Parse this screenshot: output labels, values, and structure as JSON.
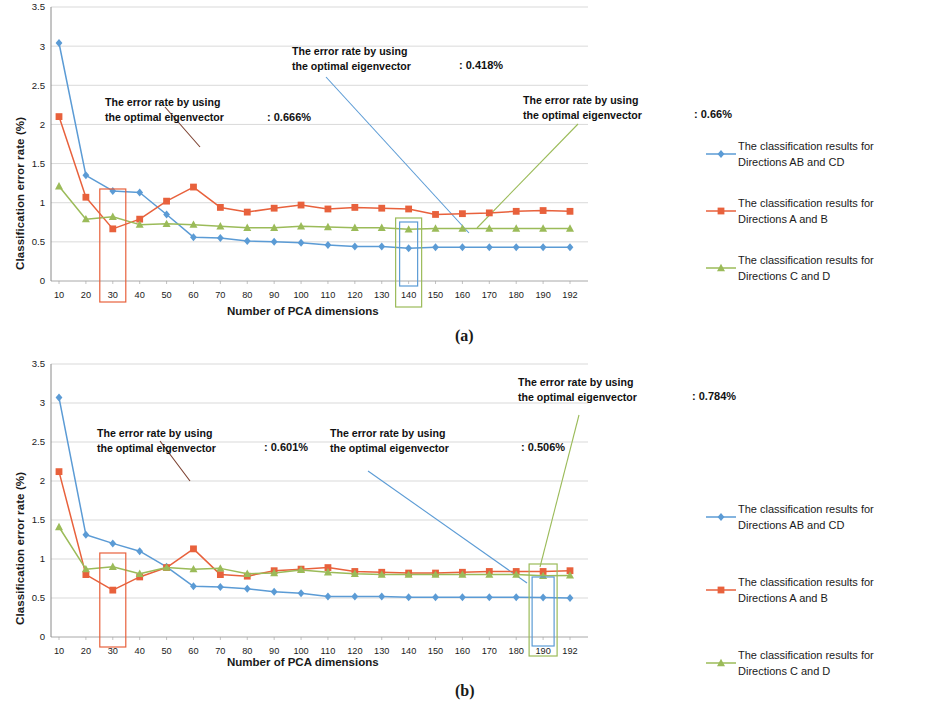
{
  "figure": {
    "panels": [
      {
        "id": "a",
        "caption": "(a)",
        "axis": {
          "ylabel": "Classification error rate (%)",
          "xlabel": "Number of PCA dimensions",
          "yticks": [
            "0",
            "0.5",
            "1",
            "1.5",
            "2",
            "2.5",
            "3",
            "3.5"
          ],
          "xticks": [
            "10",
            "20",
            "30",
            "40",
            "50",
            "60",
            "70",
            "80",
            "90",
            "100",
            "110",
            "120",
            "130",
            "140",
            "150",
            "160",
            "170",
            "180",
            "190",
            "192"
          ]
        },
        "annotations": [
          {
            "name": "annotation-30",
            "line1": "The error rate by using",
            "line2": "the optimal eigenvector",
            "value": ": 0.666%",
            "color": "#E8613C"
          },
          {
            "name": "annotation-140-blue",
            "line1": "The error rate by using",
            "line2": "the optimal eigenvector",
            "value": ": 0.418%",
            "color": "#5B9BD5"
          },
          {
            "name": "annotation-140-green",
            "line1": "The error rate by using",
            "line2": "the optimal eigenvector",
            "value": ": 0.66%",
            "color": "#9BBB59"
          }
        ],
        "highlight_boxes": [
          {
            "name": "highlight-box-30",
            "label": "30",
            "color": "#E8613C"
          },
          {
            "name": "highlight-box-140-blue",
            "label": "140",
            "color": "#5B9BD5"
          },
          {
            "name": "highlight-box-140-green",
            "label": "140",
            "color": "#9BBB59"
          }
        ]
      },
      {
        "id": "b",
        "caption": "(b)",
        "axis": {
          "ylabel": "Classification error rate (%)",
          "xlabel": "Number of PCA dimensions",
          "yticks": [
            "0",
            "0.5",
            "1",
            "1.5",
            "2",
            "2.5",
            "3",
            "3.5"
          ],
          "xticks": [
            "10",
            "20",
            "30",
            "40",
            "50",
            "60",
            "70",
            "80",
            "90",
            "100",
            "110",
            "120",
            "130",
            "140",
            "150",
            "160",
            "170",
            "180",
            "190",
            "192"
          ]
        },
        "annotations": [
          {
            "name": "annotation-30",
            "line1": "The error rate by using",
            "line2": "the optimal eigenvector",
            "value": ": 0.601%",
            "color": "#E8613C"
          },
          {
            "name": "annotation-190-blue",
            "line1": "The error rate by using",
            "line2": "the optimal eigenvector",
            "value": ": 0.506%",
            "color": "#5B9BD5"
          },
          {
            "name": "annotation-190-green",
            "line1": "The error rate by using",
            "line2": "the optimal eigenvector",
            "value": ": 0.784%",
            "color": "#9BBB59"
          }
        ],
        "highlight_boxes": [
          {
            "name": "highlight-box-30",
            "label": "30",
            "color": "#E8613C"
          },
          {
            "name": "highlight-box-190-blue",
            "label": "190",
            "color": "#5B9BD5"
          },
          {
            "name": "highlight-box-190-green",
            "label": "190",
            "color": "#9BBB59"
          }
        ]
      }
    ],
    "legend": [
      {
        "name": "legend-blue",
        "label": "The classification results for\nDirections AB and CD",
        "color": "#5B9BD5",
        "marker": "diamond"
      },
      {
        "name": "legend-red",
        "label": "The classification results for\nDirections A and B",
        "color": "#E8613C",
        "marker": "square"
      },
      {
        "name": "legend-green",
        "label": "The classification results for\nDirections C and D",
        "color": "#9BBB59",
        "marker": "triangle"
      }
    ]
  },
  "chart_data": [
    {
      "type": "line",
      "panel": "a",
      "title": "",
      "xlabel": "Number of PCA dimensions",
      "ylabel": "Classification error rate (%)",
      "ylim": [
        0,
        3.5
      ],
      "ytick_step": 0.5,
      "grid": true,
      "legend_position": "right",
      "categories": [
        10,
        20,
        30,
        40,
        50,
        60,
        70,
        80,
        90,
        100,
        110,
        120,
        130,
        140,
        150,
        160,
        170,
        180,
        190,
        192
      ],
      "series": [
        {
          "name": "The classification results for Directions AB and CD",
          "color": "#5B9BD5",
          "marker": "diamond",
          "values": [
            3.04,
            1.35,
            1.15,
            1.13,
            0.85,
            0.56,
            0.55,
            0.51,
            0.5,
            0.49,
            0.46,
            0.44,
            0.44,
            0.418,
            0.43,
            0.43,
            0.43,
            0.43,
            0.43,
            0.43
          ]
        },
        {
          "name": "The classification results for Directions A and B",
          "color": "#E8613C",
          "marker": "square",
          "values": [
            2.1,
            1.07,
            0.666,
            0.79,
            1.02,
            1.2,
            0.94,
            0.88,
            0.93,
            0.97,
            0.92,
            0.94,
            0.93,
            0.92,
            0.85,
            0.86,
            0.87,
            0.89,
            0.9,
            0.89
          ]
        },
        {
          "name": "The classification results for Directions C and D",
          "color": "#9BBB59",
          "marker": "triangle",
          "values": [
            1.21,
            0.79,
            0.82,
            0.72,
            0.73,
            0.72,
            0.7,
            0.68,
            0.68,
            0.7,
            0.69,
            0.68,
            0.68,
            0.66,
            0.67,
            0.67,
            0.67,
            0.67,
            0.67,
            0.67
          ]
        }
      ],
      "annotated_points": [
        {
          "series": "The classification results for Directions A and B",
          "x": 30,
          "y": 0.666,
          "label": "0.666%"
        },
        {
          "series": "The classification results for Directions AB and CD",
          "x": 140,
          "y": 0.418,
          "label": "0.418%"
        },
        {
          "series": "The classification results for Directions C and D",
          "x": 140,
          "y": 0.66,
          "label": "0.66%"
        }
      ]
    },
    {
      "type": "line",
      "panel": "b",
      "title": "",
      "xlabel": "Number of PCA dimensions",
      "ylabel": "Classification error rate (%)",
      "ylim": [
        0,
        3.5
      ],
      "ytick_step": 0.5,
      "grid": true,
      "legend_position": "right",
      "categories": [
        10,
        20,
        30,
        40,
        50,
        60,
        70,
        80,
        90,
        100,
        110,
        120,
        130,
        140,
        150,
        160,
        170,
        180,
        190,
        192
      ],
      "series": [
        {
          "name": "The classification results for Directions AB and CD",
          "color": "#5B9BD5",
          "marker": "diamond",
          "values": [
            3.07,
            1.31,
            1.2,
            1.1,
            0.9,
            0.65,
            0.64,
            0.62,
            0.58,
            0.56,
            0.52,
            0.52,
            0.52,
            0.51,
            0.51,
            0.51,
            0.51,
            0.51,
            0.506,
            0.5
          ]
        },
        {
          "name": "The classification results for Directions A and B",
          "color": "#E8613C",
          "marker": "square",
          "values": [
            2.12,
            0.8,
            0.601,
            0.77,
            0.89,
            1.13,
            0.8,
            0.78,
            0.85,
            0.87,
            0.89,
            0.84,
            0.83,
            0.82,
            0.82,
            0.83,
            0.84,
            0.84,
            0.84,
            0.85
          ]
        },
        {
          "name": "The classification results for Directions C and D",
          "color": "#9BBB59",
          "marker": "triangle",
          "values": [
            1.41,
            0.87,
            0.9,
            0.81,
            0.89,
            0.87,
            0.88,
            0.81,
            0.82,
            0.86,
            0.83,
            0.81,
            0.8,
            0.8,
            0.8,
            0.8,
            0.8,
            0.8,
            0.784,
            0.79
          ]
        }
      ],
      "annotated_points": [
        {
          "series": "The classification results for Directions A and B",
          "x": 30,
          "y": 0.601,
          "label": "0.601%"
        },
        {
          "series": "The classification results for Directions AB and CD",
          "x": 190,
          "y": 0.506,
          "label": "0.506%"
        },
        {
          "series": "The classification results for Directions C and D",
          "x": 190,
          "y": 0.784,
          "label": "0.784%"
        }
      ]
    }
  ]
}
